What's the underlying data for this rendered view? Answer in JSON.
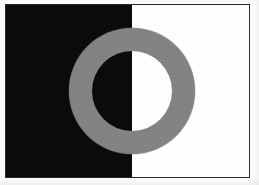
{
  "figure": {
    "caption": "",
    "background_left_label": "black field",
    "background_right_label": "white field",
    "ring_label": "gray annulus"
  },
  "colors": {
    "black_field": "#0b0b0b",
    "white_field": "#ffffff",
    "ring_gray": "#838383",
    "frame_border": "#2a2a2a",
    "page": "#fbfbfa"
  },
  "chart_data": {
    "type": "diagram",
    "elements": [
      {
        "name": "left-half-field",
        "shape": "rectangle",
        "fill": "#0b0b0b",
        "x_fraction": [
          0.0,
          0.52
        ],
        "y_fraction": [
          0.0,
          1.0
        ]
      },
      {
        "name": "right-half-field",
        "shape": "rectangle",
        "fill": "#ffffff",
        "x_fraction": [
          0.52,
          1.0
        ],
        "y_fraction": [
          0.0,
          1.0
        ]
      },
      {
        "name": "gray-annulus",
        "shape": "annulus",
        "fill": "#838383",
        "center_x_px": 128,
        "center_y_px": 91,
        "outer_diameter_px": 126,
        "inner_diameter_px": 80,
        "ring_thickness_px": 23
      }
    ],
    "frame": {
      "x_px": 5,
      "y_px": 4,
      "width_px": 245,
      "height_px": 174,
      "border_color": "#2a2a2a",
      "border_width_px": 1
    },
    "canvas": {
      "width_px": 259,
      "height_px": 185
    }
  }
}
